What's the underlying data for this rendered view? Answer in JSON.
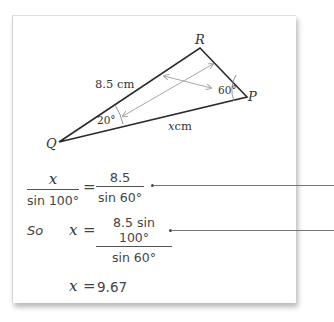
{
  "diagram": {
    "vertices": [
      {
        "name": "Q",
        "x": 59,
        "y": 142
      },
      {
        "name": "R",
        "x": 200,
        "y": 48
      },
      {
        "name": "P",
        "x": 247,
        "y": 97
      }
    ],
    "labels": {
      "R": "R",
      "P": "P",
      "Q": "Q",
      "side_QR": "8.5 cm",
      "side_QP_var": "x",
      "side_QP_unit": "cm",
      "angle_Q": "20°",
      "angle_P": "60°"
    },
    "colors": {
      "triangle": "#2a2a2a",
      "arrows": "#a8a8a8",
      "arc": "#8a8a8a"
    }
  },
  "working": {
    "line1": {
      "lhs_num": "x",
      "lhs_den": "sin 100°",
      "equals": "=",
      "rhs_num": "8.5",
      "rhs_den": "sin 60°"
    },
    "line2": {
      "prefix": "So",
      "var": "x",
      "equals": "=",
      "rhs_num": "8.5 sin 100°",
      "rhs_den": "sin 60°"
    },
    "line3": {
      "var": "x",
      "equals": "=",
      "value": "9.67"
    }
  }
}
